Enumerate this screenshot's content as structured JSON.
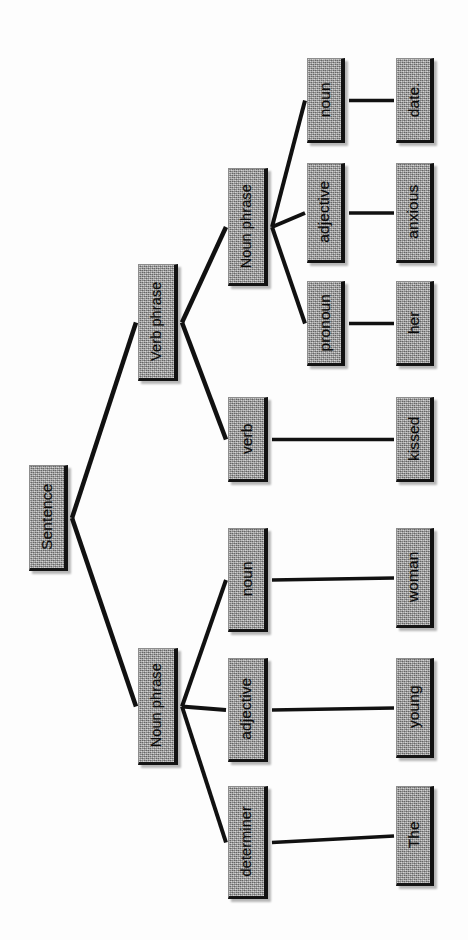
{
  "diagram": {
    "type": "syntax-tree",
    "orientation": "rotated-90-left",
    "sentence": "The young woman kissed her anxious date.",
    "colors": {
      "node_fill": "#9c9c9c",
      "node_border": "#121212",
      "edge": "#111111",
      "background": "#ffffff",
      "text": "#0b0b0b"
    },
    "nodes": [
      {
        "id": "sentence",
        "label": "Sentence",
        "x": 29,
        "y": 465,
        "w": 39,
        "h": 106,
        "level": 0
      },
      {
        "id": "vp",
        "label": "Verb phrase",
        "x": 138,
        "y": 264,
        "w": 40,
        "h": 117,
        "level": 1
      },
      {
        "id": "np_subject",
        "label": "Noun phrase",
        "x": 138,
        "y": 648,
        "w": 40,
        "h": 117,
        "level": 1
      },
      {
        "id": "np_object",
        "label": "Noun phrase",
        "x": 228,
        "y": 168,
        "w": 40,
        "h": 118,
        "level": 2
      },
      {
        "id": "verb",
        "label": "verb",
        "x": 228,
        "y": 397,
        "w": 40,
        "h": 85,
        "level": 2
      },
      {
        "id": "noun_subject",
        "label": "noun",
        "x": 228,
        "y": 528,
        "w": 40,
        "h": 104,
        "level": 2
      },
      {
        "id": "adj_subject",
        "label": "adjective",
        "x": 228,
        "y": 658,
        "w": 40,
        "h": 104,
        "level": 2
      },
      {
        "id": "determiner",
        "label": "determiner",
        "x": 228,
        "y": 786,
        "w": 40,
        "h": 113,
        "level": 2
      },
      {
        "id": "noun_object",
        "label": "noun",
        "x": 307,
        "y": 58,
        "w": 38,
        "h": 85,
        "level": 3
      },
      {
        "id": "adj_object",
        "label": "adjective",
        "x": 307,
        "y": 163,
        "w": 38,
        "h": 100,
        "level": 3
      },
      {
        "id": "pronoun",
        "label": "pronoun",
        "x": 307,
        "y": 281,
        "w": 38,
        "h": 85,
        "level": 3
      },
      {
        "id": "word_date",
        "label": "date.",
        "x": 396,
        "y": 58,
        "w": 38,
        "h": 85,
        "level": 4
      },
      {
        "id": "word_anxious",
        "label": "anxious",
        "x": 396,
        "y": 163,
        "w": 38,
        "h": 100,
        "level": 4
      },
      {
        "id": "word_her",
        "label": "her",
        "x": 396,
        "y": 281,
        "w": 38,
        "h": 85,
        "level": 4
      },
      {
        "id": "word_kissed",
        "label": "kissed",
        "x": 396,
        "y": 397,
        "w": 38,
        "h": 85,
        "level": 4
      },
      {
        "id": "word_woman",
        "label": "woman",
        "x": 396,
        "y": 528,
        "w": 38,
        "h": 100,
        "level": 4
      },
      {
        "id": "word_young",
        "label": "young",
        "x": 396,
        "y": 658,
        "w": 38,
        "h": 100,
        "level": 4
      },
      {
        "id": "word_the",
        "label": "The",
        "x": 396,
        "y": 786,
        "w": 38,
        "h": 100,
        "level": 4
      }
    ],
    "edges": [
      {
        "id": "e-sentence-vp",
        "from": "sentence",
        "to": "vp",
        "width": 4.5
      },
      {
        "id": "e-sentence-np",
        "from": "sentence",
        "to": "np_subject",
        "width": 4.5
      },
      {
        "id": "e-vp-np_object",
        "from": "vp",
        "to": "np_object",
        "width": 4.5
      },
      {
        "id": "e-vp-verb",
        "from": "vp",
        "to": "verb",
        "width": 4.5
      },
      {
        "id": "e-np_object-noun",
        "from": "np_object",
        "to": "noun_object",
        "width": 4.0
      },
      {
        "id": "e-np_object-adjective",
        "from": "np_object",
        "to": "adj_object",
        "width": 4.0
      },
      {
        "id": "e-np_object-pronoun",
        "from": "np_object",
        "to": "pronoun",
        "width": 4.0
      },
      {
        "id": "e-np_subject-noun",
        "from": "np_subject",
        "to": "noun_subject",
        "width": 4.0
      },
      {
        "id": "e-np_subject-adjective",
        "from": "np_subject",
        "to": "adj_subject",
        "width": 4.0
      },
      {
        "id": "e-np_subject-determiner",
        "from": "np_subject",
        "to": "determiner",
        "width": 4.0
      },
      {
        "id": "e-noun_object-date",
        "from": "noun_object",
        "to": "word_date",
        "width": 3.5
      },
      {
        "id": "e-adj_object-anxious",
        "from": "adj_object",
        "to": "word_anxious",
        "width": 3.5
      },
      {
        "id": "e-pronoun-her",
        "from": "pronoun",
        "to": "word_her",
        "width": 3.5
      },
      {
        "id": "e-verb-kissed",
        "from": "verb",
        "to": "word_kissed",
        "width": 3.5
      },
      {
        "id": "e-noun_subject-woman",
        "from": "noun_subject",
        "to": "word_woman",
        "width": 3.5
      },
      {
        "id": "e-adj_subject-young",
        "from": "adj_subject",
        "to": "word_young",
        "width": 3.5
      },
      {
        "id": "e-determiner-the",
        "from": "determiner",
        "to": "word_the",
        "width": 3.5
      }
    ]
  }
}
